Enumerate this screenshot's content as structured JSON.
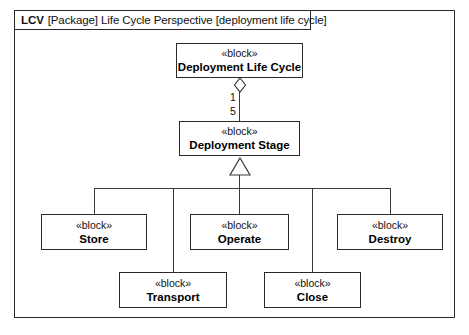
{
  "diagram": {
    "frame_header": {
      "id": "LCV",
      "rest": "[Package] Life Cycle Perspective [deployment life cycle]"
    },
    "stereotype": "«block»",
    "colors": {
      "line": "#3a3a3a",
      "border": "#2a2a2a",
      "text": "#111111",
      "background": "#ffffff"
    },
    "blocks": {
      "root": {
        "stereotype": "«block»",
        "name": "Deployment Life Cycle"
      },
      "stage": {
        "stereotype": "«block»",
        "name": "Deployment Stage"
      },
      "store": {
        "stereotype": "«block»",
        "name": "Store"
      },
      "operate": {
        "stereotype": "«block»",
        "name": "Operate"
      },
      "destroy": {
        "stereotype": "«block»",
        "name": "Destroy"
      },
      "transport": {
        "stereotype": "«block»",
        "name": "Transport"
      },
      "close": {
        "stereotype": "«block»",
        "name": "Close"
      }
    },
    "association": {
      "kind": "aggregation",
      "whole_multiplicity": "1",
      "part_multiplicity": "5"
    },
    "generalization": {
      "kind": "generalization",
      "parent": "Deployment Stage",
      "children": [
        "Store",
        "Transport",
        "Operate",
        "Close",
        "Destroy"
      ]
    }
  }
}
